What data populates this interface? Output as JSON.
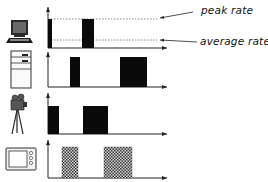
{
  "annotations": {
    "peak_label": "peak rate",
    "average_label": "average rate"
  },
  "colors": {
    "bar": "#0a0a0a",
    "hatched_bar": "#7a7a7a",
    "axis": "#222222",
    "dash": "#555555"
  },
  "rows": [
    {
      "source": "computer-terminal",
      "pattern": "solid",
      "bars": [
        [
          48,
          52
        ],
        [
          82,
          94
        ]
      ]
    },
    {
      "source": "server-tower",
      "pattern": "solid",
      "bars": [
        [
          70,
          80
        ],
        [
          120,
          147
        ]
      ]
    },
    {
      "source": "film-camera",
      "pattern": "solid",
      "bars": [
        [
          48,
          59
        ],
        [
          83,
          108
        ]
      ]
    },
    {
      "source": "television",
      "pattern": "hatched",
      "bars": [
        [
          62,
          78
        ],
        [
          104,
          132
        ]
      ]
    }
  ]
}
